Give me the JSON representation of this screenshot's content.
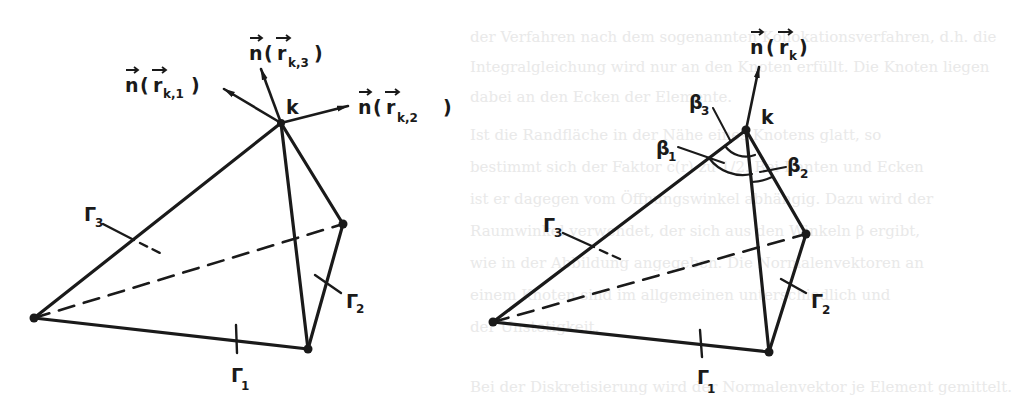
{
  "figure": {
    "stroke_color": "#1a1a1a",
    "background_color": "#ffffff",
    "left_panel": {
      "vertex_label": "k",
      "normals": [
        {
          "name": "n",
          "arg": "r",
          "sub": "k,1"
        },
        {
          "name": "n",
          "arg": "r",
          "sub": "k,3"
        },
        {
          "name": "n",
          "arg": "r",
          "sub": "k,2"
        }
      ],
      "faces": [
        {
          "label": "Γ",
          "sub": "1"
        },
        {
          "label": "Γ",
          "sub": "2"
        },
        {
          "label": "Γ",
          "sub": "3"
        }
      ]
    },
    "right_panel": {
      "vertex_label": "k",
      "normal": {
        "name": "n",
        "arg": "r",
        "sub": "k"
      },
      "angles": [
        {
          "label": "β",
          "sub": "1"
        },
        {
          "label": "β",
          "sub": "2"
        },
        {
          "label": "β",
          "sub": "3"
        }
      ],
      "faces": [
        {
          "label": "Γ",
          "sub": "1"
        },
        {
          "label": "Γ",
          "sub": "2"
        },
        {
          "label": "Γ",
          "sub": "3"
        }
      ]
    }
  },
  "bleed_through_text": [
    "der Verfahren nach dem sogenannten Kollokationsverfahren, d.h. die",
    "Integralgleichung wird nur an den Knoten erfüllt. Die Knoten liegen",
    "dabei an den Ecken der Elemente.",
    "Ist die Randfläche in der Nähe eines Knotens glatt, so",
    "bestimmt sich der Faktor c(r) zu 1/2. Bei Kanten und Ecken",
    "ist er dagegen vom Öffnungswinkel abhängig. Dazu wird der",
    "Raumwinkel verwendet, der sich aus den Winkeln β ergibt,",
    "wie in der Abbildung angegeben. Die Normalenvektoren an",
    "einem Knoten sind im allgemeinen unterschiedlich und",
    "der Unstetigkeit.",
    "Bei der Diskretisierung wird der Normalenvektor je Element gemittelt."
  ]
}
